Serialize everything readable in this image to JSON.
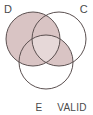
{
  "figure": {
    "type": "venn-diagram-3-circle",
    "background_color": "#ffffff",
    "stroke_color": "#5b5050",
    "shade_color": "#d9c4c4",
    "shade_color_light": "#e6d8d8",
    "text_color": "#4a4a4a"
  },
  "labels": {
    "top_left": "D",
    "top_right": "C",
    "bottom_left": "E",
    "bottom_right": "VALID"
  },
  "circles": [
    {
      "id": "D",
      "label": "D",
      "cx": 33,
      "cy": 39,
      "r": 27,
      "shaded": true
    },
    {
      "id": "C",
      "label": "C",
      "cx": 59,
      "cy": 39,
      "r": 27,
      "shaded": false
    },
    {
      "id": "E",
      "label": "E",
      "cx": 46,
      "cy": 62,
      "r": 27,
      "shaded": false
    }
  ],
  "shaded_regions": [
    {
      "name": "D-only",
      "description": "D minus C minus E",
      "shaded": true
    },
    {
      "name": "D-and-C",
      "description": "D intersect C minus E",
      "shaded": true
    },
    {
      "name": "D-and-E",
      "description": "D intersect E minus C",
      "shaded": true
    },
    {
      "name": "D-and-C-and-E",
      "description": "triple intersection",
      "shaded": true
    },
    {
      "name": "C-and-E",
      "description": "C intersect E minus D",
      "shaded": true
    },
    {
      "name": "C-only",
      "description": "C minus D minus E",
      "shaded": false
    },
    {
      "name": "E-only",
      "description": "E minus D minus C",
      "shaded": false
    }
  ]
}
